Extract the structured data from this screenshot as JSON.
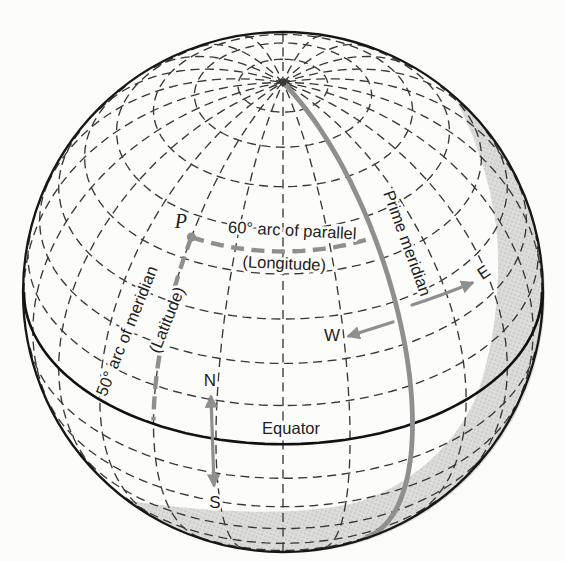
{
  "figure": {
    "labels": {
      "point": "P",
      "arc_parallel": "60° arc of parallel",
      "arc_parallel_sub": "(Longitude)",
      "arc_meridian": "50° arc of meridian",
      "arc_meridian_sub": "(Latitude)",
      "prime_meridian": "Prime meridian",
      "equator": "Equator",
      "north": "N",
      "south": "S",
      "west": "W",
      "east": "E"
    },
    "colors": {
      "background": "#fcfcfa",
      "ink": "#1e1e1e",
      "graticule": "#383838",
      "limb": "#161616",
      "equator": "#111111",
      "accent_gray": "#8f8f8f",
      "shade": "#dcdcd9",
      "shade_dot": "#b3b3af"
    }
  }
}
